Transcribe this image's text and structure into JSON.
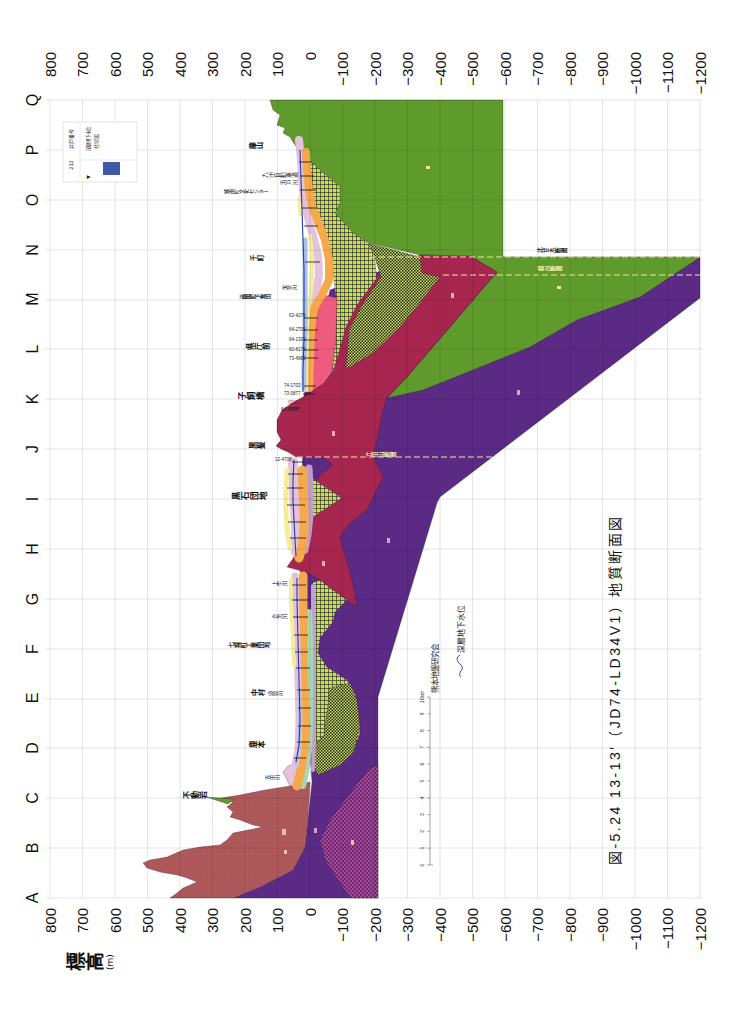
{
  "figure": {
    "title": "図-5.24 13-13′（JD74-LD34V1）地質断面図",
    "credit": "熊本地盤研究会"
  },
  "axis": {
    "label": "標高",
    "unit": "(m)",
    "ticks": [
      "800",
      "700",
      "600",
      "500",
      "400",
      "300",
      "200",
      "100",
      "0",
      "−100",
      "−200",
      "−300",
      "−400",
      "−500",
      "−600",
      "−700",
      "−800",
      "−900",
      "−1000",
      "−1100",
      "−1200"
    ]
  },
  "sections": [
    "A",
    "B",
    "C",
    "D",
    "E",
    "F",
    "G",
    "H",
    "I",
    "J",
    "K",
    "L",
    "M",
    "N",
    "O",
    "P",
    "Q"
  ],
  "place_labels": [
    {
      "name": "藤山",
      "section": "P"
    },
    {
      "name": "九州自動車道",
      "section": "O-P"
    },
    {
      "name": "浜戸川",
      "section": "O-P"
    },
    {
      "name": "城南町文化センター",
      "section": "O-P"
    },
    {
      "name": "千町",
      "section": "N"
    },
    {
      "name": "加勢川",
      "section": "M-N"
    },
    {
      "name": "画図町下無田",
      "section": "M"
    },
    {
      "name": "県庁前",
      "section": "L"
    },
    {
      "name": "子飼橋",
      "section": "K"
    },
    {
      "name": "白川",
      "section": "K"
    },
    {
      "name": "黒髪",
      "section": "J"
    },
    {
      "name": "黒石団地",
      "section": "I"
    },
    {
      "name": "上生川",
      "section": "G"
    },
    {
      "name": "合志川",
      "section": "F-G"
    },
    {
      "name": "七城町工業団地",
      "section": "F"
    },
    {
      "name": "中村",
      "section": "E"
    },
    {
      "name": "迫間川",
      "section": "E"
    },
    {
      "name": "鹿本",
      "section": "D"
    },
    {
      "name": "吉田川",
      "section": "C-D"
    },
    {
      "name": "不動岩",
      "section": "C"
    }
  ],
  "boreholes": [
    "63-4276",
    "64-2700",
    "64-1309",
    "60-8178",
    "73-4960",
    "74-1703",
    "73-0877",
    "64-5102",
    "12-4708"
  ],
  "faults": [
    {
      "name": "北甘木断層"
    },
    {
      "name": "緑川断層"
    },
    {
      "name": "立田山断層"
    }
  ],
  "legend": {
    "well_number": "212",
    "well_number_label": "井戸番号",
    "groundwater_symbol": "▼",
    "groundwater_label": "深層地下水位",
    "column_label": "柱状図"
  },
  "groundwater_key": {
    "label": "深層地下水位"
  },
  "scale_bar": {
    "ticks": [
      "0",
      "1",
      "2",
      "3",
      "4",
      "5",
      "6",
      "7",
      "8",
      "9",
      "10km"
    ]
  },
  "colors": {
    "green_unit": "#5e9b2c",
    "basement_purple": "#5b2a85",
    "crimson_unit": "#a6264f",
    "pink_unit": "#ef5b7f",
    "yellow_green_hatch": "#c9df5b",
    "mountain_unit": "#b55e60",
    "dotted_unit": "#6c2b78",
    "orange_strip": "#f5a94b",
    "lavender_strip": "#e4c2de",
    "yellow_strip": "#f4ee9c",
    "blue_strip": "#a9c0ea",
    "teal_strip": "#a5d8b5",
    "groundwater_line": "#2b3d9e",
    "fault_line": "#efe4a0"
  }
}
